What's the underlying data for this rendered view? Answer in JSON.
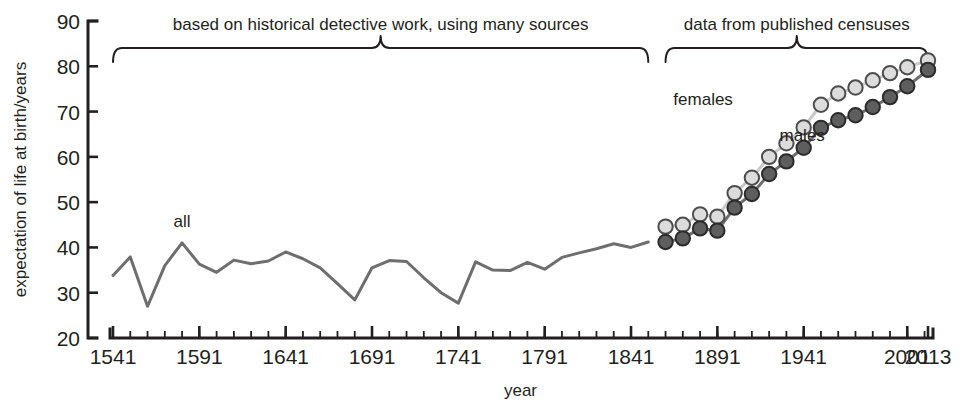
{
  "chart_data": {
    "type": "line",
    "title": "",
    "xlabel": "year",
    "ylabel": "expectation of life at birth/years",
    "xlim": [
      1541,
      2013
    ],
    "ylim": [
      20,
      90
    ],
    "grid": false,
    "legend_position": "inline-annotations",
    "y_ticks": [
      20,
      30,
      40,
      50,
      60,
      70,
      80,
      90
    ],
    "y_tick_labels": [
      "20",
      "30",
      "40",
      "50",
      "60",
      "70",
      "80",
      "90"
    ],
    "x_ticks": [
      1541,
      1591,
      1641,
      1691,
      1741,
      1791,
      1841,
      1891,
      1941,
      2001,
      2013
    ],
    "x_tick_labels": [
      "1541",
      "1591",
      "1641",
      "1691",
      "1741",
      "1791",
      "1841",
      "1891",
      "1941",
      "2001",
      "2013"
    ],
    "x_minor_tick_interval": 10,
    "annotations": [
      {
        "name": "left-bracket-annotation",
        "text": "based on historical detective work, using many sources",
        "x_start": 1541,
        "x_end": 1851,
        "text_x": 1696
      },
      {
        "name": "right-bracket-annotation",
        "text": "data from published censuses",
        "x_start": 1861,
        "x_end": 2013,
        "text_x": 1937
      }
    ],
    "series": [
      {
        "name": "all",
        "label": "all",
        "marker": "none",
        "color": "#6e6e6e",
        "label_x": 1581,
        "label_y": 44.5,
        "x": [
          1541,
          1551,
          1561,
          1571,
          1581,
          1591,
          1601,
          1611,
          1621,
          1631,
          1641,
          1651,
          1661,
          1671,
          1681,
          1691,
          1701,
          1711,
          1721,
          1731,
          1741,
          1751,
          1761,
          1771,
          1781,
          1791,
          1801,
          1811,
          1821,
          1831,
          1841,
          1851
        ],
        "y": [
          33.8,
          37.9,
          27.0,
          36.0,
          41.0,
          36.3,
          34.5,
          37.2,
          36.4,
          37.0,
          39.0,
          37.5,
          35.5,
          32.0,
          28.4,
          35.5,
          37.1,
          36.9,
          33.3,
          30.0,
          27.7,
          36.8,
          35.0,
          34.9,
          36.7,
          35.2,
          37.8,
          38.8,
          39.7,
          40.8,
          40.0,
          41.2
        ]
      },
      {
        "name": "females",
        "label": "females",
        "marker": "circle",
        "color": "#dcdcdc",
        "label_x": 1900,
        "label_y": 71.5,
        "x": [
          1861,
          1871,
          1881,
          1891,
          1901,
          1911,
          1921,
          1931,
          1941,
          1951,
          1961,
          1971,
          1981,
          1991,
          2001,
          2013
        ],
        "y": [
          44.6,
          45.0,
          47.3,
          46.8,
          52.0,
          55.4,
          60.0,
          63.0,
          66.5,
          71.5,
          74.0,
          75.3,
          76.9,
          78.5,
          79.8,
          81.3
        ]
      },
      {
        "name": "males",
        "label": "males",
        "marker": "circle",
        "color": "#5e5e5e",
        "label_x": 1927,
        "label_y": 63.5,
        "x": [
          1861,
          1871,
          1881,
          1891,
          1901,
          1911,
          1921,
          1931,
          1941,
          1951,
          1961,
          1971,
          1981,
          1991,
          2001,
          2013
        ],
        "y": [
          41.2,
          42.0,
          44.2,
          43.7,
          48.8,
          51.8,
          56.2,
          59.0,
          62.0,
          66.4,
          68.1,
          69.2,
          71.0,
          73.2,
          75.6,
          79.2
        ]
      }
    ]
  },
  "labels": {
    "y_axis_title": "expectation of life at birth/years",
    "x_axis_title": "year"
  }
}
